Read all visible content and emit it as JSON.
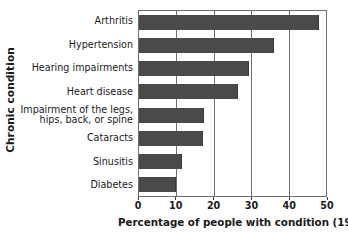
{
  "chart_data": {
    "type": "bar",
    "orientation": "horizontal",
    "title": "",
    "xlabel": "Percentage of people with condition (1996)",
    "ylabel": "Chronic condition",
    "categories": [
      "Arthritis",
      "Hypertension",
      "Hearing impairments",
      "Heart disease",
      "Impairment of the legs,\nhips, back, or spine",
      "Cataracts",
      "Sinusitis",
      "Diabetes"
    ],
    "values": [
      48,
      36,
      29.5,
      26.5,
      17.5,
      17,
      11.5,
      10
    ],
    "xlim": [
      0,
      50
    ],
    "xticks": [
      0,
      10,
      20,
      30,
      40,
      50
    ],
    "xtick_labels": [
      "0",
      "10",
      "20",
      "30",
      "40",
      "50"
    ],
    "grid": "vertical",
    "legend": "none",
    "bar_color": "#4a4a4a",
    "frame_color": "#6f6f6f",
    "background": "#ffffff"
  }
}
